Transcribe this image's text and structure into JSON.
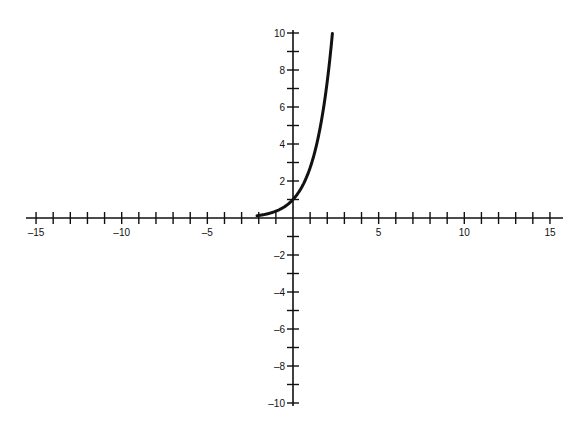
{
  "chart_data": {
    "type": "line",
    "title": "",
    "xlabel": "",
    "ylabel": "",
    "function": "y = e^x",
    "xlim": [
      -15,
      15
    ],
    "ylim": [
      -10,
      10
    ],
    "x_tick_step": 1,
    "y_tick_step": 1,
    "x_tick_labels": [
      "-15",
      "-10",
      "-5",
      "5",
      "10",
      "15"
    ],
    "x_tick_label_values": [
      -15,
      -10,
      -5,
      5,
      10,
      15
    ],
    "y_tick_labels": [
      "10",
      "8",
      "6",
      "4",
      "2",
      "-2",
      "-4",
      "-6",
      "-8",
      "-10"
    ],
    "y_tick_label_values": [
      10,
      8,
      6,
      4,
      2,
      -2,
      -4,
      -6,
      -8,
      -10
    ],
    "grid": false,
    "legend": null,
    "series": [
      {
        "name": "e^x",
        "x": [
          -2.1,
          -1.5,
          -1,
          -0.5,
          0,
          0.5,
          1,
          1.5,
          2,
          2.3
        ],
        "values": [
          0.12,
          0.22,
          0.37,
          0.61,
          1.0,
          1.65,
          2.72,
          4.48,
          7.39,
          9.97
        ],
        "x_start": -2.1,
        "x_end": 2.3
      }
    ]
  },
  "colors": {
    "axis": "#111111",
    "curve": "#111111",
    "background": "#ffffff"
  }
}
